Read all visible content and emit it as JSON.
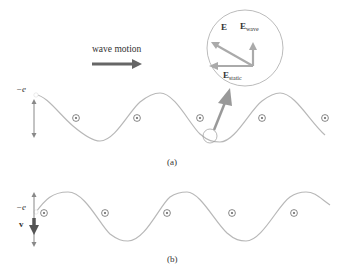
{
  "wave_motion_label": "wave motion",
  "panel_a": {
    "caption": "(a)",
    "charge_label": "−e",
    "inset": {
      "e_total_label": "E",
      "e_wave_label": "E",
      "e_wave_sub": "wave",
      "e_static_label": "E",
      "e_static_sub": "static"
    }
  },
  "panel_b": {
    "caption": "(b)",
    "charge_label": "−e",
    "velocity_label": "v"
  },
  "colors": {
    "wave_line": "#b8b8b8",
    "arrow_dark": "#666666",
    "arrow_light": "#a8a8a8",
    "circle": "#555555",
    "text": "#333333"
  }
}
